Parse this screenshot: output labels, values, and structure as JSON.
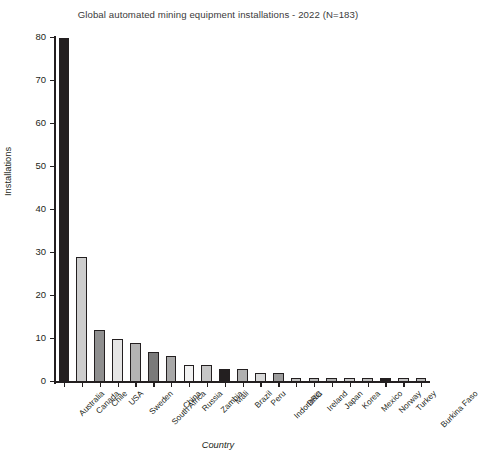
{
  "chart_data": {
    "type": "bar",
    "title": "Global automated mining equipment installations - 2022 (N=183)",
    "xlabel": "Country",
    "ylabel": "Installations",
    "ylim": [
      0,
      80
    ],
    "ytick_values": [
      0,
      10,
      20,
      30,
      40,
      50,
      60,
      70,
      80
    ],
    "ytick_labels": [
      "0",
      "10",
      "20",
      "30",
      "40",
      "50",
      "60",
      "70",
      "80"
    ],
    "grid": false,
    "legend": false,
    "categories": [
      "Australia",
      "Canada",
      "Chile",
      "USA",
      "Sweden",
      "South Africa",
      "China",
      "Russia",
      "Zambia",
      "Mali",
      "Brazil",
      "Peru",
      "Indonesia",
      "DRC",
      "Ireland",
      "Japan",
      "Korea",
      "Mexico",
      "Norway",
      "Turkey",
      "Burkina Faso"
    ],
    "values": [
      80,
      29,
      12,
      10,
      9,
      7,
      6,
      4,
      4,
      3,
      3,
      2,
      2,
      1,
      1,
      1,
      1,
      1,
      1,
      1,
      1
    ],
    "bar_colors": [
      "#231f20",
      "#cdcdcd",
      "#8f8f8f",
      "#e6e6e6",
      "#b4b4b4",
      "#7a7a7a",
      "#a8a8a8",
      "#f2f2f2",
      "#c6c6c6",
      "#231f20",
      "#b0b0b0",
      "#d8d8d8",
      "#9c9c9c",
      "#c0c0c0",
      "#b8b8b8",
      "#adadad",
      "#cacaca",
      "#bdbdbd",
      "#231f20",
      "#c4c4c4",
      "#b6b6b6"
    ],
    "bar_edge_color": "#231f20",
    "axis_color": "#231f20",
    "background": "#ffffff"
  }
}
